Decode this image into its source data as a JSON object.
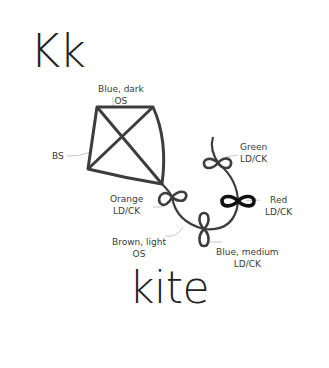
{
  "title": {
    "letters": "Kk",
    "word": "kite"
  },
  "labels": {
    "blue_dark": {
      "line1": "Blue, dark",
      "line2": "OS"
    },
    "bs": {
      "line1": "BS"
    },
    "green": {
      "line1": "Green",
      "line2": "LD/CK"
    },
    "red": {
      "line1": "Red",
      "line2": "LD/CK"
    },
    "orange": {
      "line1": "Orange",
      "line2": "LD/CK"
    },
    "brown_light": {
      "line1": "Brown, light",
      "line2": "OS"
    },
    "blue_medium": {
      "line1": "Blue, medium",
      "line2": "LD/CK"
    }
  },
  "colors": {
    "stroke": "#3d3d3d",
    "red_bow": "#111111",
    "leader": "#c8c8c8"
  }
}
